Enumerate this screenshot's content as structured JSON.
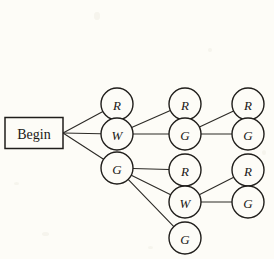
{
  "diagram": {
    "type": "probability-tree",
    "title": "Begin",
    "background_color": "#fdfcf7",
    "line_color": "#2c2a26",
    "node_fill": "#fdfcf7",
    "node_stroke": "#201e1b",
    "root": {
      "label": "Begin",
      "shape": "rectangle",
      "x": 34,
      "y": 133,
      "width": 58,
      "height": 31
    },
    "nodes": [
      {
        "id": "n1",
        "label": "R",
        "level": 1,
        "x": 117,
        "y": 104,
        "r": 16
      },
      {
        "id": "n2",
        "label": "W",
        "level": 1,
        "x": 117,
        "y": 134,
        "r": 16
      },
      {
        "id": "n3",
        "label": "G",
        "level": 1,
        "x": 117,
        "y": 168,
        "r": 16
      },
      {
        "id": "n4",
        "label": "R",
        "level": 2,
        "x": 185,
        "y": 104,
        "r": 16
      },
      {
        "id": "n5",
        "label": "G",
        "level": 2,
        "x": 185,
        "y": 134,
        "r": 16
      },
      {
        "id": "n6",
        "label": "R",
        "level": 2,
        "x": 185,
        "y": 170,
        "r": 16
      },
      {
        "id": "n7",
        "label": "W",
        "level": 2,
        "x": 185,
        "y": 202,
        "r": 16
      },
      {
        "id": "n8",
        "label": "G",
        "level": 2,
        "x": 185,
        "y": 238,
        "r": 16
      },
      {
        "id": "n9",
        "label": "R",
        "level": 3,
        "x": 248,
        "y": 104,
        "r": 16
      },
      {
        "id": "n10",
        "label": "G",
        "level": 3,
        "x": 248,
        "y": 134,
        "r": 16
      },
      {
        "id": "n11",
        "label": "R",
        "level": 3,
        "x": 248,
        "y": 170,
        "r": 16
      },
      {
        "id": "n12",
        "label": "G",
        "level": 3,
        "x": 248,
        "y": 202,
        "r": 16
      }
    ],
    "edges": [
      {
        "from": "root",
        "to": "n1"
      },
      {
        "from": "root",
        "to": "n2"
      },
      {
        "from": "root",
        "to": "n3"
      },
      {
        "from": "n2",
        "to": "n4"
      },
      {
        "from": "n2",
        "to": "n5"
      },
      {
        "from": "n3",
        "to": "n6"
      },
      {
        "from": "n3",
        "to": "n7"
      },
      {
        "from": "n3",
        "to": "n8"
      },
      {
        "from": "n5",
        "to": "n9"
      },
      {
        "from": "n5",
        "to": "n10"
      },
      {
        "from": "n7",
        "to": "n11"
      },
      {
        "from": "n7",
        "to": "n12"
      }
    ]
  }
}
